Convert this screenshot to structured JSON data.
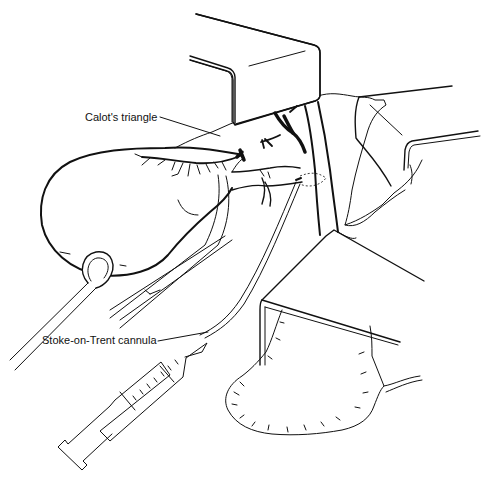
{
  "figure": {
    "labels": {
      "calots_triangle": "Calot's triangle",
      "cannula": "Stoke-on-Trent cannula"
    },
    "structures": [
      "gallbladder",
      "cystic-artery",
      "cystic-duct",
      "common-bile-duct",
      "upper-retractor",
      "right-retractor",
      "lower-retractor",
      "sponge-forceps",
      "dissecting-forceps",
      "cannula",
      "syringe",
      "gauze-swab"
    ],
    "colors": {
      "ink": "#111111",
      "paper": "#ffffff"
    }
  }
}
